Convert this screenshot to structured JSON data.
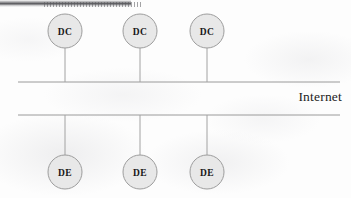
{
  "diagram": {
    "internet_label": "Internet",
    "colors": {
      "node_fill": "#e8e8e8",
      "node_stroke": "#9d9d9d",
      "line": "#9a9a9a",
      "connector": "#a2a2a2",
      "text": "#171717",
      "background": "#fdfdfd"
    },
    "backbone": {
      "upper_line": {
        "x1": 18,
        "y1": 82,
        "x2": 340,
        "y2": 82
      },
      "lower_line": {
        "x1": 18,
        "y1": 115,
        "x2": 340,
        "y2": 115
      }
    },
    "top_nodes": [
      {
        "label": "DC",
        "cx": 65,
        "cy": 31,
        "r": 17,
        "stem_y1": 48,
        "stem_y2": 82
      },
      {
        "label": "DC",
        "cx": 140,
        "cy": 31,
        "r": 17,
        "stem_y1": 48,
        "stem_y2": 82
      },
      {
        "label": "DC",
        "cx": 207,
        "cy": 31,
        "r": 17,
        "stem_y1": 48,
        "stem_y2": 82
      }
    ],
    "bottom_nodes": [
      {
        "label": "DE",
        "cx": 65,
        "cy": 172,
        "r": 17,
        "stem_y1": 115,
        "stem_y2": 155
      },
      {
        "label": "DE",
        "cx": 140,
        "cy": 172,
        "r": 17,
        "stem_y1": 115,
        "stem_y2": 155
      },
      {
        "label": "DE",
        "cx": 207,
        "cy": 172,
        "r": 17,
        "stem_y1": 115,
        "stem_y2": 155
      }
    ]
  }
}
